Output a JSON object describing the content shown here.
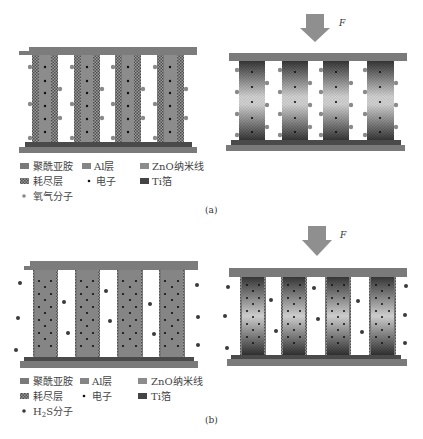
{
  "figure": {
    "panels": [
      {
        "id": "a",
        "caption": "(a)",
        "force_label": "F",
        "gas_legend_label": "氧气分子",
        "states": [
          "unstrained",
          "compressed"
        ]
      },
      {
        "id": "b",
        "caption": "(b)",
        "force_label": "F",
        "gas_legend_label_main": "H",
        "gas_legend_label_sub": "2",
        "gas_legend_label_tail": "S分子",
        "states": [
          "unstrained",
          "compressed"
        ]
      }
    ],
    "legend": {
      "polyimide": "聚酰亚胺",
      "al_layer": "Al层",
      "zno_nanowire": "ZnO纳米线",
      "depletion_layer": "耗尽层",
      "electron": "电子",
      "ti_foil": "Ti箔"
    },
    "colors": {
      "polyimide": "#7a7a7a",
      "al_layer": "#858585",
      "zno_core": "#8c8c8c",
      "depletion": "#6e6e6e",
      "ti_foil": "#444444",
      "electron": "#111111",
      "oxygen": "#8a8a8a",
      "h2s": "#3a3a3a",
      "arrow": "#8f8f8f"
    }
  }
}
